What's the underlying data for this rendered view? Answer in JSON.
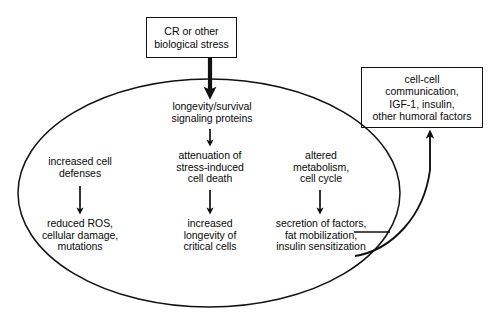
{
  "figure": {
    "type": "flow-diagram",
    "background_color": "#ffffff",
    "line_color": "#111111",
    "text_color": "#0a0a0a"
  },
  "nodes": {
    "cr_stress": {
      "label": "CR or other\nbiological stress",
      "shape": "rectangle"
    },
    "cell_cell": {
      "label": "cell-cell\ncommunication,\nIGF-1, insulin,\nother humoral factors",
      "shape": "rectangle"
    },
    "longevity_signaling": {
      "label": "longevity/survival\nsignaling proteins",
      "shape": "plain-text"
    },
    "increased_defenses": {
      "label": "increased cell\ndefenses",
      "shape": "plain-text"
    },
    "reduced_ros": {
      "label": "reduced ROS,\ncellular damage,\nmutations",
      "shape": "plain-text"
    },
    "attenuation": {
      "label": "attenuation of\nstress-induced\ncell death",
      "shape": "plain-text"
    },
    "increased_longevity": {
      "label": "increased\nlongevity of\ncritical cells",
      "shape": "plain-text"
    },
    "altered_metabolism": {
      "label": "altered\nmetabolism,\ncell cycle",
      "shape": "plain-text"
    },
    "secretion": {
      "label": "secretion of factors,\nfat mobilization,\ninsulin sensitization",
      "shape": "plain-text"
    }
  },
  "container": {
    "shape": "ellipse",
    "label": ""
  },
  "edges": [
    {
      "from": "cr_stress",
      "to": "longevity_signaling",
      "style": "thick-arrow"
    },
    {
      "from": "longevity_signaling",
      "to": "attenuation",
      "style": "thin-arrow"
    },
    {
      "from": "increased_defenses",
      "to": "reduced_ros",
      "style": "thin-arrow"
    },
    {
      "from": "attenuation",
      "to": "increased_longevity",
      "style": "thin-arrow"
    },
    {
      "from": "altered_metabolism",
      "to": "secretion",
      "style": "thin-arrow"
    },
    {
      "from": "secretion",
      "to": "cell_cell",
      "style": "curved-feedback-arrow"
    }
  ]
}
